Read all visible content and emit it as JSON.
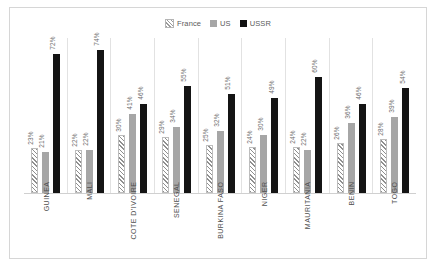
{
  "chart_data": {
    "type": "bar",
    "title": "",
    "xlabel": "",
    "ylabel": "",
    "ylim": [
      0,
      80
    ],
    "grid": false,
    "legend_position": "top-center",
    "value_suffix": "%",
    "categories": [
      "GUINEA",
      "MALI",
      "COTE D'IVOIRE",
      "SENEGAL",
      "BURKINA FASO",
      "NIGER",
      "MAURITANIA",
      "BENIN",
      "TOGO"
    ],
    "series": [
      {
        "name": "France",
        "color": "#ffffff",
        "pattern": "diagonal-hatch",
        "values": [
          23,
          22,
          30,
          29,
          25,
          24,
          24,
          26,
          28
        ]
      },
      {
        "name": "US",
        "color": "#a6a6a6",
        "pattern": "solid",
        "values": [
          21,
          22,
          41,
          34,
          32,
          30,
          22,
          36,
          39
        ]
      },
      {
        "name": "USSR",
        "color": "#141414",
        "pattern": "solid",
        "values": [
          72,
          74,
          46,
          55,
          51,
          49,
          60,
          46,
          54
        ]
      }
    ],
    "data_labels": [
      {
        "category": "GUINEA",
        "France": "23%",
        "US": "21%",
        "USSR": "72%"
      },
      {
        "category": "MALI",
        "France": "22%",
        "US": "22%",
        "USSR": "74%"
      },
      {
        "category": "COTE D'IVOIRE",
        "France": "30%",
        "US": "41%",
        "USSR": "46%"
      },
      {
        "category": "SENEGAL",
        "France": "29%",
        "US": "34%",
        "USSR": "55%"
      },
      {
        "category": "BURKINA FASO",
        "France": "25%",
        "US": "32%",
        "USSR": "51%"
      },
      {
        "category": "NIGER",
        "France": "24%",
        "US": "30%",
        "USSR": "49%"
      },
      {
        "category": "MAURITANIA",
        "France": "24%",
        "US": "22%",
        "USSR": "60%"
      },
      {
        "category": "BENIN",
        "France": "26%",
        "US": "36%",
        "USSR": "46%"
      },
      {
        "category": "TOGO",
        "France": "28%",
        "US": "39%",
        "USSR": "54%"
      }
    ]
  },
  "legend": {
    "items": [
      {
        "label": "France",
        "swatch": "france-hatch-swatch"
      },
      {
        "label": "US",
        "swatch": "us-gray-swatch"
      },
      {
        "label": "USSR",
        "swatch": "ussr-black-swatch"
      }
    ]
  }
}
